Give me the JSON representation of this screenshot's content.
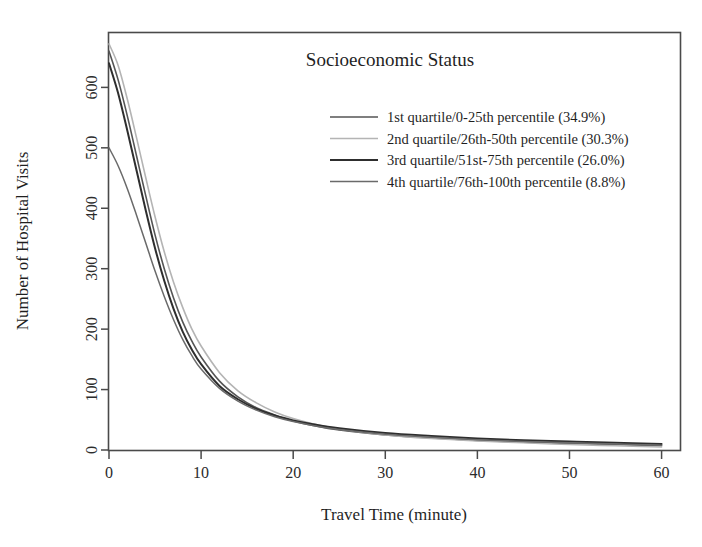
{
  "chart_data": {
    "type": "line",
    "title": "Socioeconomic Status",
    "xlabel": "Travel Time (minute)",
    "ylabel": "Number of Hospital Visits",
    "xlim": [
      0,
      62
    ],
    "ylim": [
      0,
      690
    ],
    "xticks": [
      0,
      10,
      20,
      30,
      40,
      50,
      60
    ],
    "xtick_labels": [
      "0",
      "10",
      "20",
      "30",
      "40",
      "50",
      "60"
    ],
    "yticks": [
      0,
      100,
      200,
      300,
      400,
      500,
      600
    ],
    "ytick_labels": [
      "0",
      "100",
      "200",
      "300",
      "400",
      "500",
      "600"
    ],
    "grid": false,
    "legend_position": "upper-center-right",
    "x": [
      0,
      1,
      2,
      3,
      4,
      5,
      6,
      7,
      8,
      9,
      10,
      12,
      14,
      16,
      18,
      20,
      22,
      25,
      30,
      35,
      40,
      45,
      50,
      55,
      60
    ],
    "series": [
      {
        "name": "1st quartile/0-25th percentile (34.9%)",
        "label": "1st quartile/0-25th percentile (34.9%)",
        "quartile": "1st quartile",
        "percentile_range": "0-25th percentile",
        "share_percent": 34.9,
        "color": "#555555",
        "line_width": 1.6,
        "values": [
          660,
          612,
          552,
          486,
          420,
          356,
          300,
          252,
          212,
          180,
          154,
          114,
          88,
          70,
          58,
          48,
          41,
          33,
          25,
          20,
          16,
          13,
          11,
          9,
          7
        ]
      },
      {
        "name": "2nd quartile/26th-50th percentile (30.3%)",
        "label": "2nd quartile/26th-50th percentile (30.3%)",
        "quartile": "2nd quartile",
        "percentile_range": "26th-50th percentile",
        "share_percent": 30.3,
        "color": "#b4b4b4",
        "line_width": 1.6,
        "values": [
          672,
          636,
          580,
          516,
          450,
          386,
          328,
          278,
          236,
          200,
          172,
          128,
          98,
          78,
          63,
          52,
          44,
          35,
          25,
          19,
          15,
          12,
          9,
          7,
          5
        ]
      },
      {
        "name": "3rd quartile/51st-75th percentile (26.0%)",
        "label": "3rd quartile/51st-75th percentile (26.0%)",
        "quartile": "3rd quartile",
        "percentile_range": "51st-75th percentile",
        "share_percent": 26.0,
        "color": "#2e2e2e",
        "line_width": 2.0,
        "values": [
          640,
          590,
          528,
          462,
          396,
          334,
          280,
          234,
          196,
          166,
          142,
          106,
          84,
          68,
          57,
          49,
          43,
          36,
          28,
          23,
          19,
          16,
          14,
          12,
          10
        ]
      },
      {
        "name": "4th quartile/76th-100th percentile (8.8%)",
        "label": "4th quartile/76th-100th percentile (8.8%)",
        "quartile": "4th quartile",
        "percentile_range": "76th-100th percentile",
        "share_percent": 8.8,
        "color": "#6a6a6a",
        "line_width": 1.5,
        "values": [
          500,
          470,
          432,
          388,
          342,
          296,
          254,
          216,
          183,
          156,
          134,
          102,
          81,
          66,
          55,
          47,
          41,
          34,
          26,
          21,
          17,
          14,
          12,
          10,
          8
        ]
      }
    ]
  },
  "legend": {
    "entries": [
      "1st quartile/0-25th percentile (34.9%)",
      "2nd quartile/26th-50th percentile (30.3%)",
      "3rd quartile/51st-75th percentile (26.0%)",
      "4th quartile/76th-100th percentile (8.8%)"
    ]
  }
}
